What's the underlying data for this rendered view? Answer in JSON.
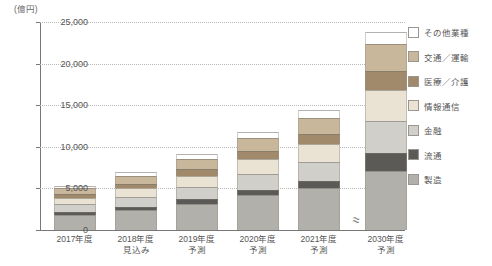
{
  "chart_data": {
    "type": "bar",
    "stacked": true,
    "title": "",
    "unit_label": "(億円)",
    "xlabel": "",
    "ylabel": "",
    "ylim": [
      0,
      25000
    ],
    "ytick_values": [
      0,
      5000,
      10000,
      15000,
      20000,
      25000
    ],
    "ytick_labels": [
      "0",
      "5,000",
      "10,000",
      "15,000",
      "20,000",
      "25,000"
    ],
    "grid": true,
    "legend_position": "right",
    "axis_break": true,
    "axis_break_symbol": "≈",
    "categories": [
      "2017年度",
      "2018年度\n見込み",
      "2019年度\n予測",
      "2020年度\n予測",
      "2021年度\n予測",
      "2030年度\n予測"
    ],
    "series": [
      {
        "name": "製造",
        "color": "#b2b0ab",
        "values": [
          1850,
          2400,
          3150,
          4150,
          5000,
          7100
        ]
      },
      {
        "name": "流通",
        "color": "#5c5a56",
        "values": [
          330,
          420,
          540,
          700,
          900,
          2100
        ]
      },
      {
        "name": "金融",
        "color": "#d0cfca",
        "values": [
          900,
          1150,
          1500,
          1900,
          2300,
          3900
        ]
      },
      {
        "name": "情報通信",
        "color": "#eae3d4",
        "values": [
          800,
          1050,
          1350,
          1750,
          2150,
          3750
        ]
      },
      {
        "name": "医療／介護",
        "color": "#a08a6b",
        "values": [
          420,
          560,
          760,
          1000,
          1250,
          2250
        ]
      },
      {
        "name": "交通／運輸",
        "color": "#c9b79c",
        "values": [
          700,
          900,
          1200,
          1550,
          1900,
          3300
        ]
      },
      {
        "name": "その他業種",
        "color": "#ffffff",
        "values": [
          350,
          450,
          600,
          750,
          900,
          1400
        ]
      }
    ],
    "totals": [
      5350,
      6930,
      9100,
      11800,
      14400,
      23800
    ],
    "legend_order_top_to_bottom": [
      "その他業種",
      "交通／運輸",
      "医療／介護",
      "情報通信",
      "金融",
      "流通",
      "製造"
    ]
  }
}
